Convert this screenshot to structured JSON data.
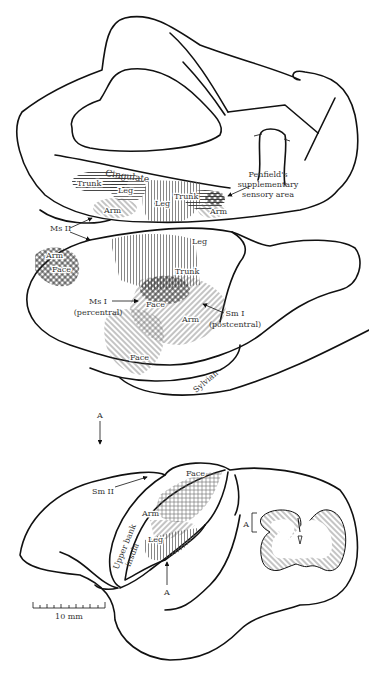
{
  "figure": {
    "panels": [
      {
        "id": "medial-view",
        "labels": {
          "cingulate": "Cingulate",
          "trunk_left": "Trunk",
          "leg_left": "Leg",
          "arm_left": "Arm",
          "leg_center": "Leg",
          "trunk_right": "Trunk",
          "arm_right": "Arm",
          "penfield_line1": "Penfield's",
          "penfield_line2": "supplementary",
          "penfield_line3": "sensory area",
          "ms2": "Ms II"
        }
      },
      {
        "id": "lateral-view",
        "labels": {
          "arm_ms2": "Arm",
          "face_ms2": "Face",
          "leg": "Leg",
          "trunk": "Trunk",
          "face_upper": "Face",
          "arm": "Arm",
          "face_lower": "Face",
          "ms1_line1": "Ms I",
          "ms1_line2": "(percentral)",
          "sm1_line1": "Sm I",
          "sm1_line2": "(postcentral)",
          "sylvian": "Sylvian"
        }
      },
      {
        "id": "insula-view",
        "labels": {
          "arrow_top": "A",
          "sm2": "Sm II",
          "face": "Face",
          "arm": "Arm",
          "leg": "Leg",
          "upper_bank_line1": "Upper bank",
          "upper_bank_line2": "insula",
          "arrow_bottom": "A",
          "section_a": "A",
          "scale": "10 mm"
        }
      }
    ],
    "colors": {
      "ink": "#111111",
      "text": "#333333",
      "hatch": "#444444",
      "background": "#ffffff"
    }
  }
}
